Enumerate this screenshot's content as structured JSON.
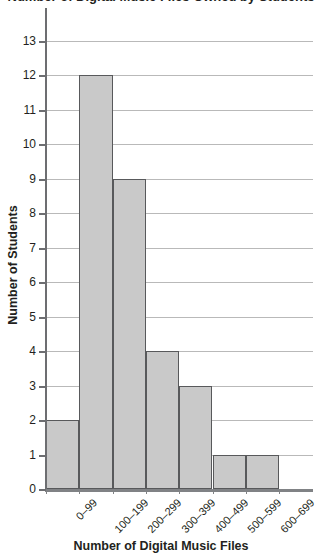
{
  "chart_data": {
    "type": "bar",
    "title": "Number of Digital Music Files Owned by Students",
    "categories": [
      "0–99",
      "100–199",
      "200–299",
      "300–399",
      "400–499",
      "500–599",
      "600–699"
    ],
    "values": [
      2,
      12,
      9,
      4,
      3,
      1,
      1
    ],
    "xlabel": "Number of Digital Music Files",
    "ylabel": "Number of Students",
    "ylim": [
      0,
      13
    ],
    "ytick_labels": [
      "13",
      "12",
      "11",
      "10",
      "9",
      "8",
      "7",
      "6",
      "5",
      "4",
      "3",
      "2",
      "1",
      "0"
    ],
    "ytick_values": [
      13,
      12,
      11,
      10,
      9,
      8,
      7,
      6,
      5,
      4,
      3,
      2,
      1,
      0
    ],
    "ytick_step": 1,
    "grid": "horizontal",
    "legend": "none",
    "bar_fill_color": "#c9c9c9",
    "bar_edge_color": "#58595b",
    "gridline_color": "#b9b9b9",
    "axis_color": "#6d6e71",
    "text_color": "#231f20"
  }
}
